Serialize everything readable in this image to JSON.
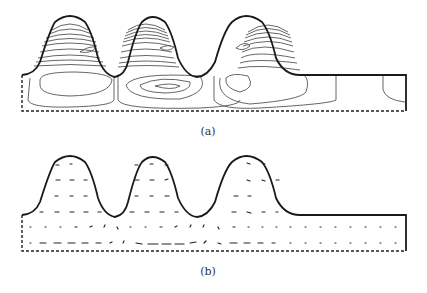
{
  "figure": {
    "panels": [
      {
        "id": "a",
        "label": "(a)",
        "kind": "streamline-contours",
        "description": "Contour lines inside three bumps above a rectangular channel"
      },
      {
        "id": "b",
        "label": "(b)",
        "kind": "velocity-vectors",
        "description": "Velocity arrow field inside three bumps above a rectangular channel"
      }
    ],
    "colors": {
      "outline": "#1a1a1a",
      "contour": "#555555",
      "arrow": "#222222",
      "dashed_boundary": "#222222"
    }
  }
}
